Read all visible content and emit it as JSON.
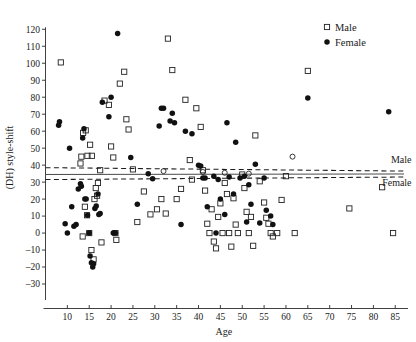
{
  "chart_data": {
    "type": "scatter",
    "title": "",
    "xlabel": "Age",
    "ylabel": "(DH) style-shift",
    "xlim": [
      5,
      87
    ],
    "ylim": [
      -35,
      124
    ],
    "xticks": [
      10,
      15,
      20,
      25,
      30,
      35,
      40,
      45,
      50,
      55,
      60,
      65,
      70,
      75,
      80,
      85
    ],
    "yticks": [
      -30,
      -20,
      -10,
      0,
      10,
      20,
      30,
      40,
      50,
      60,
      70,
      80,
      90,
      100,
      110,
      120
    ],
    "grid": false,
    "legend_position": "top-right",
    "legend": [
      {
        "label": "Male",
        "marker": "open-square"
      },
      {
        "label": "Female",
        "marker": "filled-circle"
      }
    ],
    "annotations": [
      {
        "text": "Male",
        "x": 84,
        "y": 41,
        "note": "label for male dashed trend line"
      },
      {
        "text": "Female",
        "x": 82,
        "y": 28,
        "note": "label for female dashed trend line"
      }
    ],
    "trend_lines": [
      {
        "name": "Male",
        "style": "dashed",
        "x0": 5,
        "y0": 38.5,
        "x1": 87,
        "y1": 36.5
      },
      {
        "name": "Female",
        "style": "dashed",
        "x0": 5,
        "y0": 31.5,
        "x1": 87,
        "y1": 33.0
      },
      {
        "name": "Overall",
        "style": "solid",
        "x0": 5,
        "y0": 34.5,
        "x1": 87,
        "y1": 34.8
      }
    ],
    "series": [
      {
        "name": "Male",
        "marker": "open-square",
        "points": [
          [
            8.5,
            100.5
          ],
          [
            13.0,
            41.0
          ],
          [
            13.5,
            -2.0
          ],
          [
            14.0,
            15.5
          ],
          [
            14.5,
            10.5
          ],
          [
            15.0,
            0.0
          ],
          [
            15.5,
            -10.0
          ],
          [
            16.0,
            -15.5
          ],
          [
            16.5,
            26.5
          ],
          [
            16.8,
            22.0
          ],
          [
            13.2,
            45.0
          ],
          [
            13.6,
            59.0
          ],
          [
            14.2,
            60.5
          ],
          [
            14.6,
            45.5
          ],
          [
            15.2,
            52.0
          ],
          [
            15.6,
            45.5
          ],
          [
            16.2,
            20.0
          ],
          [
            17.0,
            29.5
          ],
          [
            17.5,
            37.0
          ],
          [
            18.5,
            78.0
          ],
          [
            19.5,
            75.5
          ],
          [
            20.0,
            51.0
          ],
          [
            20.5,
            44.5
          ],
          [
            21.0,
            0.0
          ],
          [
            21.2,
            -4.0
          ],
          [
            17.8,
            -5.5
          ],
          [
            22.0,
            88.0
          ],
          [
            23.0,
            95.0
          ],
          [
            23.5,
            67.0
          ],
          [
            24.0,
            61.0
          ],
          [
            25.0,
            37.5
          ],
          [
            26.0,
            6.5
          ],
          [
            27.5,
            24.5
          ],
          [
            29.0,
            11.0
          ],
          [
            30.5,
            14.0
          ],
          [
            31.5,
            20.0
          ],
          [
            32.5,
            11.5
          ],
          [
            33.0,
            114.5
          ],
          [
            34.0,
            96.0
          ],
          [
            35.0,
            20.0
          ],
          [
            36.0,
            26.0
          ],
          [
            37.0,
            78.5
          ],
          [
            38.0,
            43.0
          ],
          [
            38.5,
            31.5
          ],
          [
            39.5,
            73.5
          ],
          [
            40.5,
            62.5
          ],
          [
            41.0,
            37.0
          ],
          [
            41.5,
            25.0
          ],
          [
            42.0,
            5.5
          ],
          [
            42.5,
            0.0
          ],
          [
            43.0,
            14.0
          ],
          [
            43.5,
            -5.0
          ],
          [
            44.0,
            -9.0
          ],
          [
            44.5,
            9.5
          ],
          [
            45.0,
            17.5
          ],
          [
            45.5,
            0.0
          ],
          [
            46.0,
            29.5
          ],
          [
            46.5,
            23.0
          ],
          [
            47.0,
            0.0
          ],
          [
            47.5,
            -8.0
          ],
          [
            48.0,
            20.5
          ],
          [
            48.5,
            5.0
          ],
          [
            49.0,
            0.0
          ],
          [
            50.0,
            34.5
          ],
          [
            50.5,
            26.5
          ],
          [
            51.0,
            12.5
          ],
          [
            51.5,
            0.0
          ],
          [
            52.0,
            9.5
          ],
          [
            52.5,
            -7.5
          ],
          [
            53.0,
            57.5
          ],
          [
            54.0,
            30.5
          ],
          [
            55.0,
            18.0
          ],
          [
            55.5,
            9.0
          ],
          [
            56.0,
            5.5
          ],
          [
            56.5,
            0.0
          ],
          [
            57.0,
            -2.0
          ],
          [
            58.0,
            0.0
          ],
          [
            59.0,
            19.5
          ],
          [
            60.0,
            33.5
          ],
          [
            62.0,
            0.0
          ],
          [
            65.0,
            95.5
          ],
          [
            74.5,
            14.5
          ],
          [
            82.0,
            27.0
          ],
          [
            84.5,
            0.0
          ]
        ]
      },
      {
        "name": "Female",
        "marker": "filled-circle",
        "points": [
          [
            8.0,
            63.5
          ],
          [
            8.2,
            65.5
          ],
          [
            9.5,
            5.5
          ],
          [
            10.0,
            0.0
          ],
          [
            10.5,
            50.0
          ],
          [
            11.0,
            15.5
          ],
          [
            11.5,
            4.0
          ],
          [
            12.0,
            5.0
          ],
          [
            12.5,
            26.0
          ],
          [
            13.0,
            29.0
          ],
          [
            13.2,
            27.5
          ],
          [
            13.5,
            56.0
          ],
          [
            13.8,
            61.5
          ],
          [
            14.0,
            20.0
          ],
          [
            14.3,
            20.0
          ],
          [
            14.6,
            10.5
          ],
          [
            15.0,
            0.0
          ],
          [
            15.2,
            -13.5
          ],
          [
            15.5,
            -17.5
          ],
          [
            15.8,
            -20.0
          ],
          [
            16.0,
            -18.0
          ],
          [
            16.3,
            14.5
          ],
          [
            16.6,
            16.0
          ],
          [
            17.0,
            23.0
          ],
          [
            17.2,
            11.0
          ],
          [
            17.5,
            11.5
          ],
          [
            18.0,
            77.0
          ],
          [
            19.5,
            68.5
          ],
          [
            20.0,
            80.0
          ],
          [
            20.5,
            0.0
          ],
          [
            21.0,
            0.0
          ],
          [
            21.5,
            117.5
          ],
          [
            24.5,
            44.5
          ],
          [
            26.0,
            17.0
          ],
          [
            28.5,
            35.0
          ],
          [
            29.5,
            32.0
          ],
          [
            31.0,
            63.0
          ],
          [
            31.5,
            73.5
          ],
          [
            32.0,
            73.5
          ],
          [
            33.5,
            66.0
          ],
          [
            34.0,
            70.5
          ],
          [
            34.5,
            65.0
          ],
          [
            36.0,
            5.0
          ],
          [
            37.0,
            60.0
          ],
          [
            38.5,
            58.5
          ],
          [
            40.0,
            40.0
          ],
          [
            40.5,
            39.5
          ],
          [
            41.0,
            32.5
          ],
          [
            41.5,
            32.5
          ],
          [
            42.0,
            15.5
          ],
          [
            43.5,
            33.5
          ],
          [
            44.0,
            0.0
          ],
          [
            44.5,
            31.5
          ],
          [
            45.0,
            20.0
          ],
          [
            46.0,
            11.0
          ],
          [
            46.5,
            65.0
          ],
          [
            47.0,
            33.0
          ],
          [
            48.0,
            23.0
          ],
          [
            48.5,
            53.5
          ],
          [
            49.5,
            32.5
          ],
          [
            50.5,
            33.5
          ],
          [
            51.0,
            6.5
          ],
          [
            51.5,
            28.5
          ],
          [
            52.0,
            17.0
          ],
          [
            53.0,
            40.5
          ],
          [
            54.0,
            6.0
          ],
          [
            55.0,
            32.5
          ],
          [
            55.5,
            13.5
          ],
          [
            56.5,
            10.0
          ],
          [
            57.0,
            5.0
          ],
          [
            65.0,
            79.5
          ],
          [
            83.5,
            71.5
          ]
        ]
      },
      {
        "name": "Unfilled circles",
        "marker": "open-circle",
        "points": [
          [
            32.0,
            36.5
          ],
          [
            41.0,
            36.0
          ],
          [
            46.0,
            35.5
          ],
          [
            51.5,
            35.0
          ],
          [
            61.5,
            45.0
          ]
        ]
      }
    ]
  }
}
